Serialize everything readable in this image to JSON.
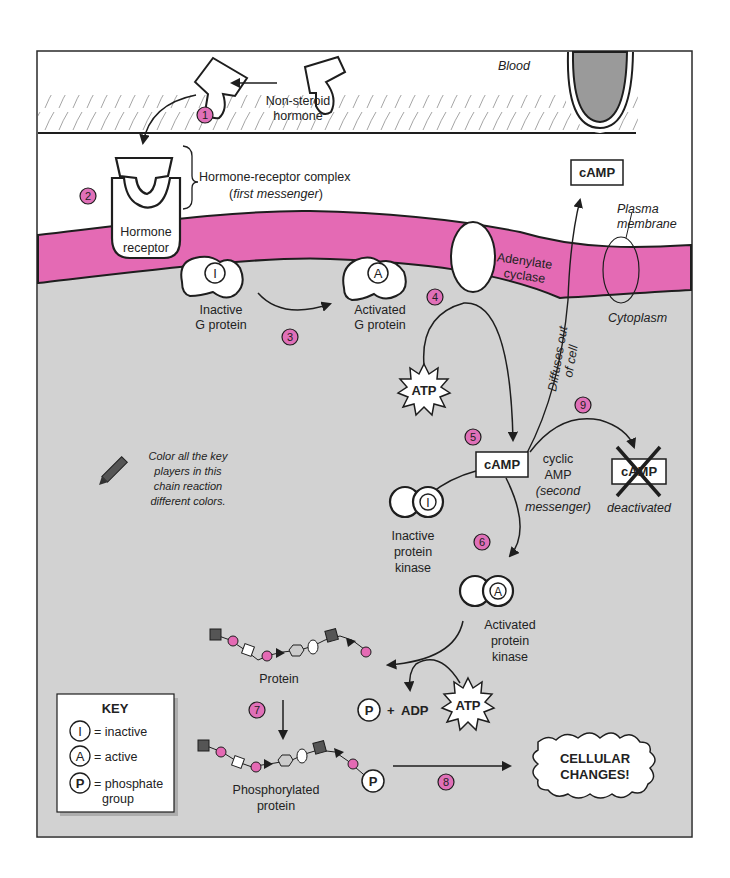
{
  "colors": {
    "membrane": "#e46ab4",
    "cytoplasm": "#d2d2d2",
    "blood_cell": "#9a9a9a",
    "step_badge": "#e070b8",
    "outline": "#1e1e1e",
    "white": "#ffffff"
  },
  "regions": {
    "blood": "Blood",
    "plasma_membrane_line1": "Plasma",
    "plasma_membrane_line2": "membrane",
    "cytoplasm": "Cytoplasm"
  },
  "labels": {
    "hormone_line1": "Non-steroid",
    "hormone_line2": "hormone",
    "complex_line1": "Hormone-receptor complex",
    "complex_line2_prefix": "(",
    "complex_line2_italic": "first messenger",
    "complex_line2_suffix": ")",
    "receptor_line1": "Hormone",
    "receptor_line2": "receptor",
    "inactive_g_line1": "Inactive",
    "inactive_g_line2": "G protein",
    "active_g_line1": "Activated",
    "active_g_line2": "G protein",
    "adenylate_line1": "Adenylate",
    "adenylate_line2": "cyclase",
    "atp": "ATP",
    "camp": "cAMP",
    "camp_out": "cAMP",
    "diffuses_line1": "Diffuses out",
    "diffuses_line2": "of cell",
    "cyclic_line1": "cyclic",
    "cyclic_line2": "AMP",
    "cyclic_line3": "(second",
    "cyclic_line4": "messenger)",
    "deactivated_camp": "cAMP",
    "deactivated": "deactivated",
    "inactive_pk_line1": "Inactive",
    "inactive_pk_line2": "protein",
    "inactive_pk_line3": "kinase",
    "active_pk_line1": "Activated",
    "active_pk_line2": "protein",
    "active_pk_line3": "kinase",
    "protein": "Protein",
    "phosphate_symbol": "P",
    "plus": "+",
    "adp": "ADP",
    "atp2": "ATP",
    "phosphorylated_line1": "Phosphorylated",
    "phosphorylated_line2": "protein",
    "cellular_line1": "CELLULAR",
    "cellular_line2": "CHANGES!",
    "inactive_symbol": "I",
    "active_symbol": "A",
    "coloring_note_line1": "Color all the key",
    "coloring_note_line2": "players in this",
    "coloring_note_line3": "chain reaction",
    "coloring_note_line4": "different colors."
  },
  "steps": [
    "1",
    "2",
    "3",
    "4",
    "5",
    "6",
    "7",
    "8",
    "9"
  ],
  "key": {
    "title": "KEY",
    "items": [
      {
        "symbol": "I",
        "text": "= inactive"
      },
      {
        "symbol": "A",
        "text": "= active"
      },
      {
        "symbol": "P",
        "text": "= phosphate",
        "text2": "group"
      }
    ]
  }
}
